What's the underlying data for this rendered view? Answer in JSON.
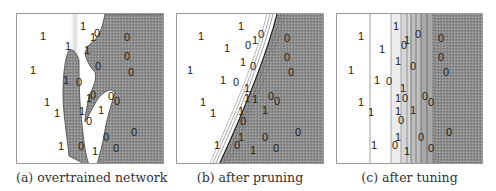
{
  "figure": {
    "panels": [
      {
        "id": "a",
        "caption": "(a) overtrained network",
        "points": [
          {
            "label": "1",
            "x": 26,
            "y": 22
          },
          {
            "label": "1",
            "x": 66,
            "y": 12
          },
          {
            "label": "0",
            "x": 80,
            "y": 19
          },
          {
            "label": "1",
            "x": 76,
            "y": 23
          },
          {
            "label": "0",
            "x": 110,
            "y": 23
          },
          {
            "label": "1",
            "x": 51,
            "y": 32
          },
          {
            "label": "1",
            "x": 70,
            "y": 36
          },
          {
            "label": "0",
            "x": 110,
            "y": 42
          },
          {
            "label": "1",
            "x": 16,
            "y": 56
          },
          {
            "label": "0",
            "x": 81,
            "y": 52
          },
          {
            "label": "0",
            "x": 114,
            "y": 58
          },
          {
            "label": "1",
            "x": 49,
            "y": 66
          },
          {
            "label": "0",
            "x": 62,
            "y": 68
          },
          {
            "label": "1",
            "x": 72,
            "y": 84
          },
          {
            "label": "0",
            "x": 76,
            "y": 81
          },
          {
            "label": "0",
            "x": 94,
            "y": 82
          },
          {
            "label": "0",
            "x": 100,
            "y": 87
          },
          {
            "label": "1",
            "x": 30,
            "y": 88
          },
          {
            "label": "1",
            "x": 40,
            "y": 99
          },
          {
            "label": "1",
            "x": 65,
            "y": 97
          },
          {
            "label": "1",
            "x": 84,
            "y": 96
          },
          {
            "label": "0",
            "x": 72,
            "y": 107
          },
          {
            "label": "0",
            "x": 89,
            "y": 123
          },
          {
            "label": "0",
            "x": 117,
            "y": 118
          },
          {
            "label": "1",
            "x": 44,
            "y": 132
          },
          {
            "label": "0",
            "x": 64,
            "y": 132
          },
          {
            "label": "1",
            "x": 78,
            "y": 137
          },
          {
            "label": "0",
            "x": 99,
            "y": 134
          }
        ]
      },
      {
        "id": "b",
        "caption": "(b) after pruning",
        "points": [
          {
            "label": "1",
            "x": 64,
            "y": 12
          },
          {
            "label": "1",
            "x": 24,
            "y": 22
          },
          {
            "label": "1",
            "x": 78,
            "y": 26
          },
          {
            "label": "0",
            "x": 84,
            "y": 20
          },
          {
            "label": "0",
            "x": 71,
            "y": 31
          },
          {
            "label": "0",
            "x": 110,
            "y": 24
          },
          {
            "label": "1",
            "x": 50,
            "y": 34
          },
          {
            "label": "1",
            "x": 66,
            "y": 48
          },
          {
            "label": "0",
            "x": 110,
            "y": 43
          },
          {
            "label": "0",
            "x": 76,
            "y": 52
          },
          {
            "label": "0",
            "x": 114,
            "y": 58
          },
          {
            "label": "1",
            "x": 13,
            "y": 56
          },
          {
            "label": "1",
            "x": 46,
            "y": 66
          },
          {
            "label": "0",
            "x": 59,
            "y": 68
          },
          {
            "label": "1",
            "x": 70,
            "y": 74
          },
          {
            "label": "1",
            "x": 70,
            "y": 84
          },
          {
            "label": "1",
            "x": 78,
            "y": 85
          },
          {
            "label": "0",
            "x": 94,
            "y": 82
          },
          {
            "label": "0",
            "x": 100,
            "y": 87
          },
          {
            "label": "1",
            "x": 26,
            "y": 88
          },
          {
            "label": "1",
            "x": 36,
            "y": 99
          },
          {
            "label": "1",
            "x": 64,
            "y": 97
          },
          {
            "label": "1",
            "x": 88,
            "y": 96
          },
          {
            "label": "0",
            "x": 66,
            "y": 107
          },
          {
            "label": "0",
            "x": 121,
            "y": 118
          },
          {
            "label": "1",
            "x": 64,
            "y": 123
          },
          {
            "label": "0",
            "x": 88,
            "y": 123
          },
          {
            "label": "1",
            "x": 40,
            "y": 131
          },
          {
            "label": "0",
            "x": 60,
            "y": 131
          },
          {
            "label": "1",
            "x": 76,
            "y": 136
          },
          {
            "label": "0",
            "x": 99,
            "y": 134
          }
        ]
      },
      {
        "id": "c",
        "caption": "(c) after tuning",
        "points": [
          {
            "label": "1",
            "x": 59,
            "y": 12
          },
          {
            "label": "1",
            "x": 24,
            "y": 22
          },
          {
            "label": "1",
            "x": 70,
            "y": 26
          },
          {
            "label": "0",
            "x": 81,
            "y": 20
          },
          {
            "label": "0",
            "x": 67,
            "y": 31
          },
          {
            "label": "0",
            "x": 104,
            "y": 24
          },
          {
            "label": "1",
            "x": 45,
            "y": 35
          },
          {
            "label": "1",
            "x": 61,
            "y": 47
          },
          {
            "label": "0",
            "x": 76,
            "y": 52
          },
          {
            "label": "0",
            "x": 104,
            "y": 43
          },
          {
            "label": "0",
            "x": 109,
            "y": 58
          },
          {
            "label": "1",
            "x": 14,
            "y": 56
          },
          {
            "label": "1",
            "x": 40,
            "y": 66
          },
          {
            "label": "0",
            "x": 52,
            "y": 67
          },
          {
            "label": "1",
            "x": 66,
            "y": 74
          },
          {
            "label": "1",
            "x": 61,
            "y": 84
          },
          {
            "label": "0",
            "x": 68,
            "y": 84
          },
          {
            "label": "0",
            "x": 88,
            "y": 82
          },
          {
            "label": "0",
            "x": 94,
            "y": 88
          },
          {
            "label": "1",
            "x": 24,
            "y": 88
          },
          {
            "label": "1",
            "x": 34,
            "y": 98
          },
          {
            "label": "1",
            "x": 61,
            "y": 97
          },
          {
            "label": "1",
            "x": 76,
            "y": 96
          },
          {
            "label": "0",
            "x": 64,
            "y": 106
          },
          {
            "label": "0",
            "x": 112,
            "y": 118
          },
          {
            "label": "1",
            "x": 61,
            "y": 123
          },
          {
            "label": "0",
            "x": 84,
            "y": 123
          },
          {
            "label": "1",
            "x": 37,
            "y": 131
          },
          {
            "label": "0",
            "x": 58,
            "y": 131
          },
          {
            "label": "1",
            "x": 70,
            "y": 137
          },
          {
            "label": "0",
            "x": 94,
            "y": 134
          }
        ]
      }
    ]
  },
  "colors": {
    "class0_region": "#8c8c8c",
    "class1_region": "#ffffff",
    "contour": "#444444",
    "border": "#9a9a9a"
  }
}
